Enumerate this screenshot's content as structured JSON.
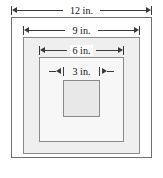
{
  "figure": {
    "unit": "in.",
    "squares": [
      {
        "name": "outer-square",
        "size": 12,
        "label": "12 in.",
        "fill": "#ffffff",
        "stroke": "#6f6f6f"
      },
      {
        "name": "second-square",
        "size": 9,
        "label": "9 in.",
        "fill": "#efefef",
        "stroke": "#8a8a8a"
      },
      {
        "name": "third-square",
        "size": 6,
        "label": "6 in.",
        "fill": "#f7f7f7",
        "stroke": "#8a8a8a"
      },
      {
        "name": "inner-square",
        "size": 3,
        "label": "3 in.",
        "fill": "#e8e8e8",
        "stroke": "#8a8a8a"
      }
    ],
    "dimensions": [
      {
        "id": "dim-12",
        "label": "12 in.",
        "value": 12,
        "arrow_style": "inward-heads"
      },
      {
        "id": "dim-9",
        "label": "9 in.",
        "value": 9,
        "arrow_style": "inward-heads"
      },
      {
        "id": "dim-6",
        "label": "6 in.",
        "value": 6,
        "arrow_style": "inward-heads"
      },
      {
        "id": "dim-3",
        "label": "3 in.",
        "value": 3,
        "arrow_style": "outward-heads"
      }
    ]
  }
}
